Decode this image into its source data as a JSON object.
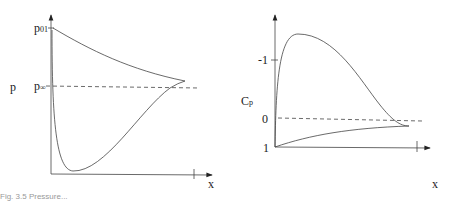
{
  "left_plot": {
    "y_label": "p",
    "x_label": "x",
    "tick_labels": [
      {
        "main": "p",
        "sub": "01"
      },
      {
        "main": "p",
        "sub": "∞"
      }
    ],
    "curves": [
      "upper surface pressure (p01 decreasing to trailing edge)",
      "lower surface pressure (drops near leading edge, recovers)"
    ],
    "reference_line": "p∞ (dashed)"
  },
  "right_plot": {
    "y_label": "C",
    "y_label_sub": "p",
    "x_label": "x",
    "tick_labels": [
      "-1",
      "0",
      "1"
    ]
  },
  "caption": "Fig. 3.5  Pressure..."
}
